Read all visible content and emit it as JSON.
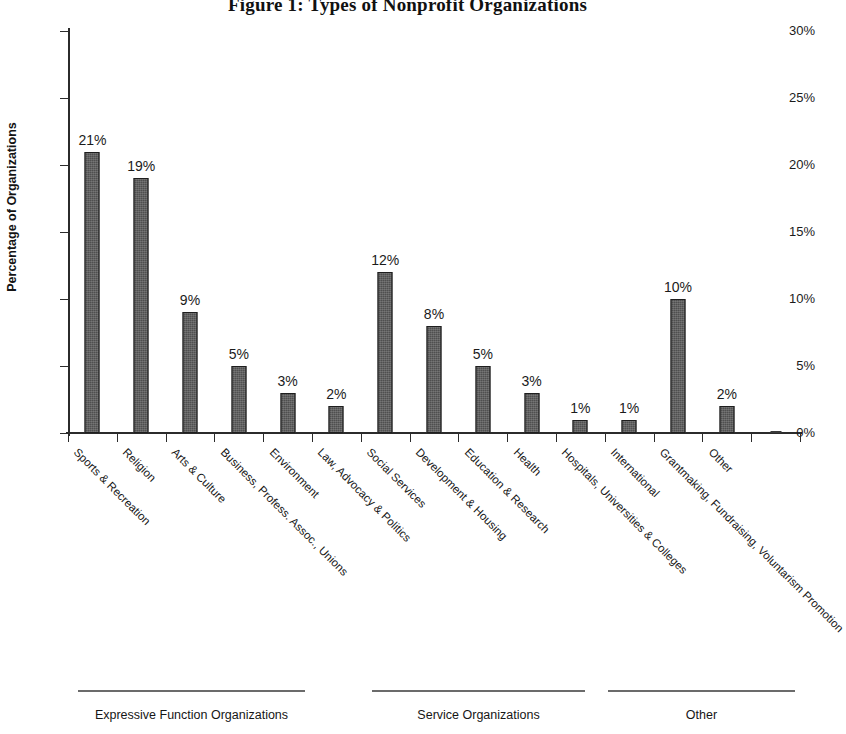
{
  "chart_data": {
    "type": "bar",
    "title": "Figure 1: Types of Nonprofit Organizations",
    "xlabel": "",
    "ylabel": "Percentage of Organizations",
    "ylim": [
      0,
      30
    ],
    "ytick_labels": [
      "0%",
      "5%",
      "10%",
      "15%",
      "20%",
      "25%",
      "30%"
    ],
    "ytick_values": [
      0,
      5,
      10,
      15,
      20,
      25,
      30
    ],
    "grid": false,
    "legend": "none",
    "value_suffix": "%",
    "bar_color": "#4f4f4f",
    "categories": [
      "Sports & Recreation",
      "Religion",
      "Arts & Culture",
      "Business, Profess. Assoc., Unions",
      "Environment",
      "Law, Advocacy & Politics",
      "Social Services",
      "Development & Housing",
      "Education & Research",
      "Health",
      "Hospitals, Universities & Colleges",
      "International",
      "Grantmaking, Fundraising, Voluntarism Promotion",
      "Other"
    ],
    "values": [
      21,
      19,
      9,
      5,
      3,
      2,
      12,
      8,
      5,
      3,
      1,
      1,
      10,
      2
    ],
    "data_labels": [
      "21%",
      "19%",
      "9%",
      "5%",
      "3%",
      "2%",
      "12%",
      "8%",
      "5%",
      "3%",
      "1%",
      "1%",
      "10%",
      "2%"
    ],
    "trailing_category": "Other",
    "trailing_value": 0,
    "groups": [
      {
        "label": "Expressive Function Organizations",
        "line_start": 78,
        "line_end": 305
      },
      {
        "label": "Service Organizations",
        "line_start": 372,
        "line_end": 585
      },
      {
        "label": "Other",
        "line_start": 608,
        "line_end": 795
      }
    ]
  }
}
